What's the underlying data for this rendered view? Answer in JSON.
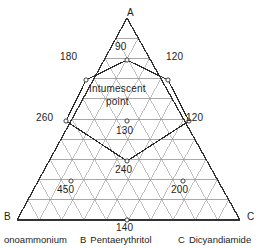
{
  "figure": {
    "type": "ternary-diagram",
    "title": "",
    "vertices": [
      {
        "id": "A",
        "label": "A",
        "x": 127,
        "y": 8,
        "component": "Monoammonium"
      },
      {
        "id": "B",
        "label": "B",
        "x": 4,
        "y": 212,
        "component": "Pentaerythritol"
      },
      {
        "id": "C",
        "label": "C",
        "x": 247,
        "y": 212,
        "component": "Dicyandiamide"
      }
    ],
    "grid": {
      "divisions": 10,
      "apex": {
        "x": 127,
        "y": 18
      },
      "left": {
        "x": 17,
        "y": 220
      },
      "right": {
        "x": 240,
        "y": 220
      },
      "show_grid": true,
      "grid_color": "#8d8d8d",
      "outline_color": "#333333"
    },
    "annotations": {
      "intumescent_point_label_line1": "Intumescent",
      "intumescent_point_label_line2": "point"
    },
    "data_points": [
      {
        "value": "90",
        "marker_x": 127,
        "marker_y": 60,
        "label_x": 115,
        "label_y": 42
      },
      {
        "value": "180",
        "marker_x": 86,
        "marker_y": 80,
        "label_x": 60,
        "label_y": 52
      },
      {
        "value": "120",
        "marker_x": 168,
        "marker_y": 80,
        "label_x": 166,
        "label_y": 52
      },
      {
        "value": "130",
        "marker_x": 127,
        "marker_y": 121,
        "label_x": 116,
        "label_y": 126
      },
      {
        "value": "260",
        "marker_x": 66,
        "marker_y": 121,
        "label_x": 36,
        "label_y": 113
      },
      {
        "value": "120",
        "marker_x": 189,
        "marker_y": 121,
        "label_x": 186,
        "label_y": 113
      },
      {
        "value": "240",
        "marker_x": 127,
        "marker_y": 161,
        "label_x": 115,
        "label_y": 165
      },
      {
        "value": "450",
        "marker_x": 71,
        "marker_y": 181,
        "label_x": 57,
        "label_y": 185
      },
      {
        "value": "200",
        "marker_x": 183,
        "marker_y": 181,
        "label_x": 171,
        "label_y": 185
      },
      {
        "value": "140",
        "marker_x": 127,
        "marker_y": 220,
        "label_x": 116,
        "label_y": 223
      }
    ],
    "contour": {
      "description": "closed polygon through labelled boundary points",
      "color": "#2b2b2b"
    },
    "caption": {
      "items": [
        {
          "key": "",
          "name": "onoammonium",
          "x": 0
        },
        {
          "key": "B",
          "name": "Pentaerythritol",
          "x": 80
        },
        {
          "key": "C",
          "name": "Dicyandiamide",
          "x": 178
        }
      ]
    }
  }
}
